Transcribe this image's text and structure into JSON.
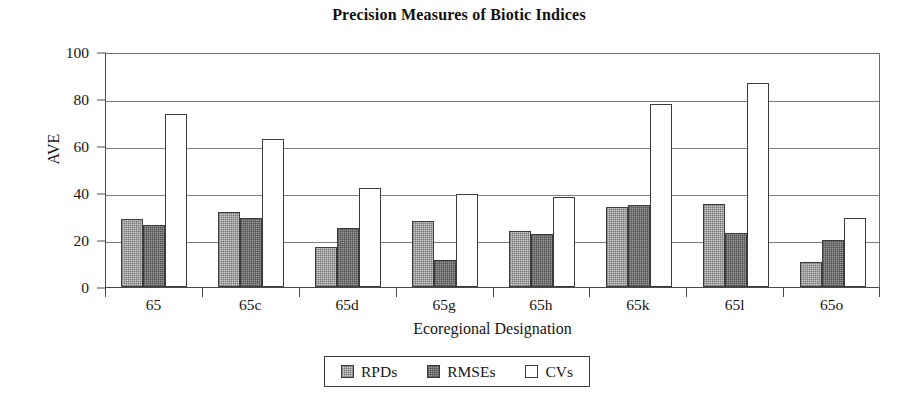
{
  "chart_data": {
    "type": "bar",
    "title": "Precision Measures of Biotic Indices",
    "xlabel": "Ecoregional Designation",
    "ylabel": "AVE",
    "ylim": [
      0,
      100
    ],
    "yticks": [
      0,
      20,
      40,
      60,
      80,
      100
    ],
    "grid": true,
    "legend_position": "bottom",
    "categories": [
      "65",
      "65c",
      "65d",
      "65g",
      "65h",
      "65k",
      "65l",
      "65o"
    ],
    "series": [
      {
        "name": "RPDs",
        "color": "#cfcfcf",
        "values": [
          29,
          32,
          17,
          28,
          24,
          34,
          35.5,
          10.5
        ]
      },
      {
        "name": "RMSEs",
        "color": "#9d9d9d",
        "values": [
          26.5,
          29.5,
          25,
          11.5,
          22.5,
          35,
          23,
          20
        ]
      },
      {
        "name": "CVs",
        "color": "#ffffff",
        "values": [
          73.5,
          63,
          42,
          39.5,
          38.5,
          78,
          87,
          29.5
        ]
      }
    ]
  },
  "legend": {
    "entries": [
      {
        "label": "RPDs",
        "swatch": "rpd"
      },
      {
        "label": "RMSEs",
        "swatch": "rmse"
      },
      {
        "label": "CVs",
        "swatch": "cv"
      }
    ]
  }
}
